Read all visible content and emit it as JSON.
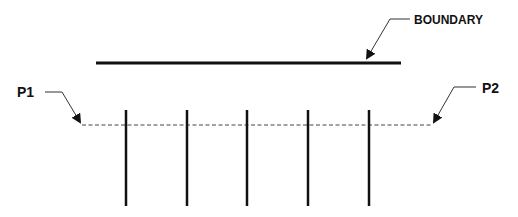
{
  "diagram": {
    "width": 518,
    "height": 217,
    "colors": {
      "stroke": "#111111",
      "dashed": "#444444",
      "background": "#ffffff"
    },
    "labels": {
      "boundary": "BOUNDARY",
      "p1": "P1",
      "p2": "P2"
    },
    "boundary_line": {
      "x1": 96,
      "y1": 63,
      "x2": 401,
      "y2": 63
    },
    "dashed_line": {
      "x1": 82,
      "y1": 125,
      "x2": 432,
      "y2": 125
    },
    "posts": [
      {
        "x": 126,
        "y1": 110,
        "y2": 206
      },
      {
        "x": 187,
        "y1": 110,
        "y2": 206
      },
      {
        "x": 247,
        "y1": 110,
        "y2": 206
      },
      {
        "x": 308,
        "y1": 110,
        "y2": 206
      },
      {
        "x": 369,
        "y1": 110,
        "y2": 206
      }
    ],
    "leaders": {
      "boundary": {
        "points": "410,19 390,19 369,54",
        "tip": [
          366,
          60
        ]
      },
      "p1": {
        "points": "45,92 62,92 76,117",
        "tip": [
          80,
          124
        ]
      },
      "p2": {
        "points": "475,87 455,87 437,117",
        "tip": [
          433,
          124
        ]
      }
    }
  }
}
